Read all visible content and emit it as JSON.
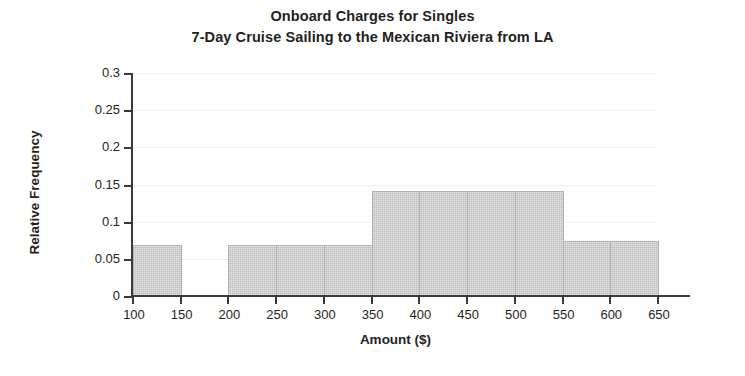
{
  "chart_data": {
    "type": "bar",
    "title": "Onboard Charges for Singles\n7-Day Cruise Sailing to the Mexican Riviera from LA",
    "title_lines": [
      "Onboard Charges for Singles",
      "7-Day Cruise Sailing to the Mexican Riviera from LA"
    ],
    "xlabel": "Amount ($)",
    "ylabel": "Relative Frequency",
    "xlim": [
      100,
      650
    ],
    "ylim": [
      0,
      0.3
    ],
    "grid": true,
    "legend": null,
    "bin_width": 50,
    "bin_edges": [
      100,
      150,
      200,
      250,
      300,
      350,
      400,
      450,
      500,
      550,
      600,
      650
    ],
    "categories": [
      "100-150",
      "150-200",
      "200-250",
      "250-300",
      "300-350",
      "350-400",
      "400-450",
      "450-500",
      "500-550",
      "550-600",
      "600-650"
    ],
    "values": [
      0.07,
      0,
      0.07,
      0.07,
      0.07,
      0.143,
      0.143,
      0.143,
      0.143,
      0.075,
      0.075
    ],
    "bars": [
      {
        "x0": 100,
        "x1": 150,
        "value": 0.07
      },
      {
        "x0": 200,
        "x1": 250,
        "value": 0.07
      },
      {
        "x0": 250,
        "x1": 300,
        "value": 0.07
      },
      {
        "x0": 300,
        "x1": 350,
        "value": 0.07
      },
      {
        "x0": 350,
        "x1": 400,
        "value": 0.143
      },
      {
        "x0": 400,
        "x1": 450,
        "value": 0.143
      },
      {
        "x0": 450,
        "x1": 500,
        "value": 0.143
      },
      {
        "x0": 500,
        "x1": 550,
        "value": 0.143
      },
      {
        "x0": 550,
        "x1": 600,
        "value": 0.075
      },
      {
        "x0": 600,
        "x1": 650,
        "value": 0.075
      }
    ],
    "xticks": [
      100,
      150,
      200,
      250,
      300,
      350,
      400,
      450,
      500,
      550,
      600,
      650
    ],
    "xtick_labels": [
      "100",
      "150",
      "200",
      "250",
      "300",
      "350",
      "400",
      "450",
      "500",
      "550",
      "600",
      "650"
    ],
    "yticks": [
      0,
      0.05,
      0.1,
      0.15,
      0.2,
      0.25,
      0.3
    ],
    "ytick_labels": [
      "0",
      "0.05",
      "0.1",
      "0.15",
      "0.2",
      "0.25",
      "0.3"
    ],
    "colors": {
      "bar_fill": "#c9c9c9",
      "bar_edge": "#adadad",
      "axis": "#3b3b3b",
      "text": "#231f20",
      "grid": "#f2f2f2",
      "background": "#ffffff"
    }
  }
}
